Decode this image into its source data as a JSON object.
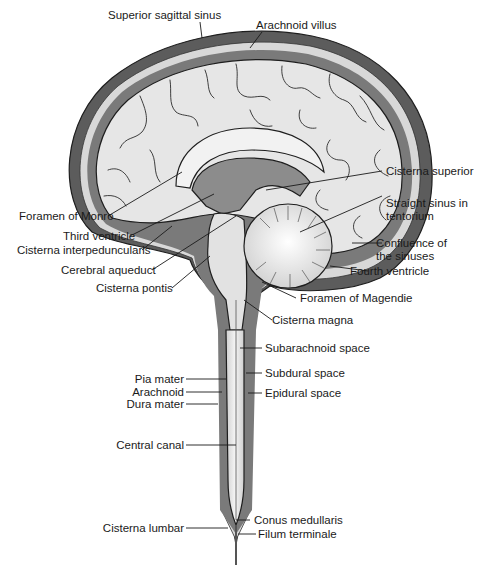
{
  "figure": {
    "colors": {
      "dura_dark": "#5c5c5c",
      "csf_medium": "#7a7a7a",
      "brain_light": "#e6e6e6",
      "brain_highlight": "#f6f6f6",
      "ventricle_gray": "#8c8c8c",
      "outline": "#1e1e1e",
      "label_text": "#1a1a1a"
    }
  },
  "labels": {
    "superior_sagittal_sinus": "Superior sagittal sinus",
    "arachnoid_villus": "Arachnoid villus",
    "cisterna_superior": "Cisterna superior",
    "straight_sinus_line1": "Straight sinus in",
    "straight_sinus_line2": "tentorium",
    "confluence_line1": "Confluence of",
    "confluence_line2": "the sinuses",
    "fourth_ventricle": "Fourth ventricle",
    "foramen_of_monro": "Foramen of Monro",
    "third_ventricle": "Third ventricle",
    "cisterna_interpeduncularis": "Cisterna interpeduncularis",
    "cerebral_aqueduct": "Cerebral aqueduct",
    "cisterna_pontis": "Cisterna pontis",
    "foramen_of_magendie": "Foramen of Magendie",
    "cisterna_magna": "Cisterna magna",
    "subarachnoid_space": "Subarachnoid space",
    "subdural_space": "Subdural space",
    "epidural_space": "Epidural space",
    "pia_mater": "Pia mater",
    "arachnoid": "Arachnoid",
    "dura_mater": "Dura mater",
    "central_canal": "Central canal",
    "cisterna_lumbar": "Cisterna lumbar",
    "conus_medullaris": "Conus medullaris",
    "filum_terminale": "Filum terminale"
  }
}
